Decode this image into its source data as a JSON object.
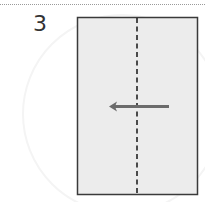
{
  "step": {
    "number": "3"
  },
  "diagram": {
    "type": "origami-fold-step",
    "paper_color": "#ececec",
    "border_color": "#3a3a3a",
    "fold_line": "valley-fold-dashed-vertical-center",
    "arrow_direction": "left",
    "arrow_color": "#6b6b6b"
  }
}
